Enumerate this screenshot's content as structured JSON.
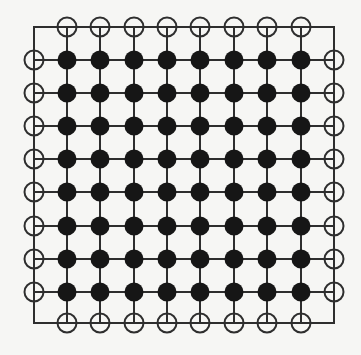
{
  "diagram": {
    "type": "lattice-grid",
    "interior": {
      "rows": 8,
      "cols": 8,
      "node_style": "filled"
    },
    "boundary": {
      "node_style": "hollow",
      "top_count": 8,
      "bottom_count": 8,
      "left_count": 8,
      "right_count": 8
    },
    "geometry": {
      "frame": {
        "left": 34,
        "top": 27,
        "right": 334,
        "bottom": 323
      },
      "col_x": [
        67,
        100,
        134,
        167,
        200,
        234,
        267,
        301
      ],
      "row_y": [
        60,
        93,
        126,
        159,
        192,
        226,
        259,
        292
      ],
      "node_radius": 9.5,
      "hollow_radius": 9.5
    },
    "colors": {
      "background": "#f6f6f4",
      "line": "#2e2e2e",
      "filled_node": "#161616",
      "hollow_stroke": "#2e2e2e"
    }
  }
}
